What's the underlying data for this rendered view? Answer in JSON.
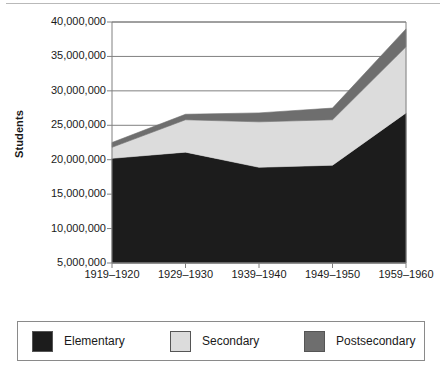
{
  "chart_data": {
    "type": "area",
    "stacked": true,
    "title": "",
    "subtitle": "",
    "xlabel": "",
    "ylabel": "Students",
    "categories": [
      "1919–1920",
      "1929–1930",
      "1939–1940",
      "1949–1950",
      "1959–1960"
    ],
    "series": [
      {
        "name": "Elementary",
        "color": "#1c1c1c",
        "values": [
          20200000,
          21100000,
          18900000,
          19200000,
          26800000
        ]
      },
      {
        "name": "Secondary",
        "color": "#dcdcdc",
        "values": [
          1600000,
          4700000,
          6600000,
          6600000,
          9600000
        ]
      },
      {
        "name": "Postsecondary",
        "color": "#6e6e6e",
        "values": [
          700000,
          800000,
          1300000,
          1700000,
          2600000
        ]
      }
    ],
    "cumulative_tops": [
      [
        20200000,
        21800000,
        22500000
      ],
      [
        21100000,
        25800000,
        26600000
      ],
      [
        18900000,
        25500000,
        26800000
      ],
      [
        19200000,
        25800000,
        27500000
      ],
      [
        26800000,
        36400000,
        39000000
      ]
    ],
    "ylim": [
      5000000,
      40000000
    ],
    "y_ticks": [
      5000000,
      10000000,
      15000000,
      20000000,
      25000000,
      30000000,
      35000000,
      40000000
    ],
    "y_tick_labels": [
      "5,000,000",
      "10,000,000",
      "15,000,000",
      "20,000,000",
      "25,000,000",
      "30,000,000",
      "35,000,000",
      "40,000,000"
    ],
    "grid": true,
    "grid_axis": "y",
    "legend_position": "bottom"
  },
  "axes": {
    "y_title": "Students"
  },
  "legend": {
    "entries": [
      {
        "label": "Elementary",
        "color": "#1c1c1c"
      },
      {
        "label": "Secondary",
        "color": "#dcdcdc"
      },
      {
        "label": "Postsecondary",
        "color": "#6e6e6e"
      }
    ]
  },
  "colors": {
    "elementary": "#1c1c1c",
    "secondary": "#dcdcdc",
    "postsecondary": "#6e6e6e",
    "axis": "#808080",
    "grid": "#808080",
    "text": "#1a1a1a"
  }
}
